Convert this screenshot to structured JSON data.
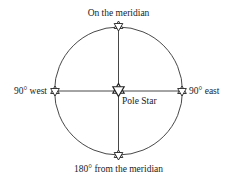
{
  "diagram": {
    "center": {
      "label": "Pole Star",
      "icon": "star-of-david-icon"
    },
    "positions": [
      {
        "id": "top",
        "label": "On the meridian",
        "icon": "star-of-david-icon"
      },
      {
        "id": "left",
        "label": "90° west",
        "icon": "star-of-david-icon"
      },
      {
        "id": "right",
        "label": "90° east",
        "icon": "star-of-david-icon"
      },
      {
        "id": "bottom",
        "label": "180° from the meridian",
        "icon": "star-of-david-icon"
      }
    ],
    "colors": {
      "line": "#333333",
      "text": "#222222",
      "background": "#ffffff"
    }
  }
}
